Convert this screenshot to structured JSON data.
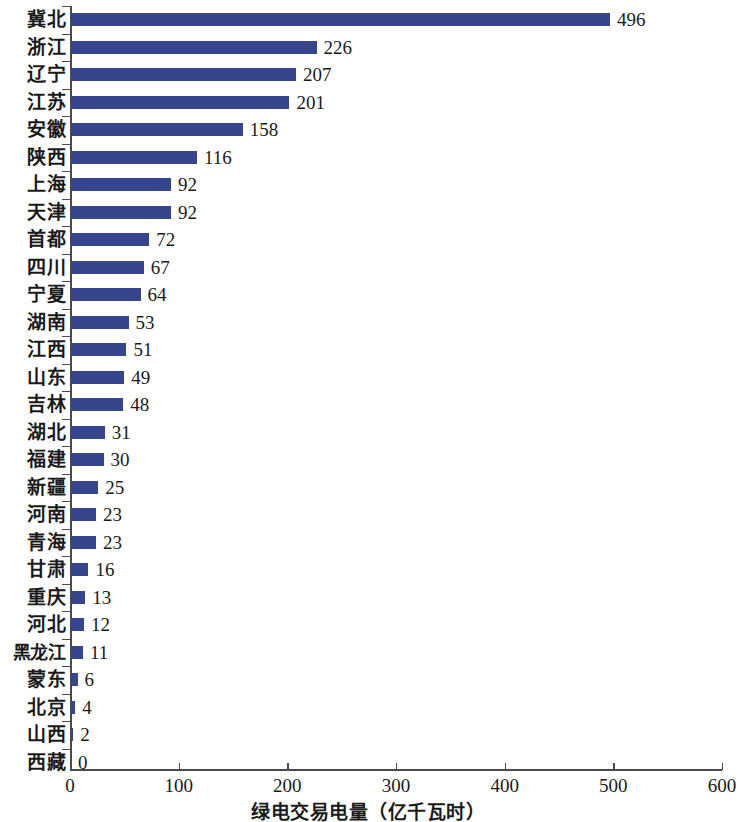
{
  "chart_data": {
    "type": "bar",
    "orientation": "horizontal",
    "title": "",
    "xlabel": "绿电交易电量（亿千瓦时）",
    "ylabel": "",
    "xlim": [
      0,
      600
    ],
    "xticks": [
      0,
      100,
      200,
      300,
      400,
      500,
      600
    ],
    "xtick_labels": [
      "0",
      "100",
      "200",
      "300",
      "400",
      "500",
      "600"
    ],
    "grid": false,
    "legend": null,
    "bar_color": "#37458c",
    "value_labels": true,
    "sorted": "descending",
    "categories": [
      "冀北",
      "浙江",
      "辽宁",
      "江苏",
      "安徽",
      "陕西",
      "上海",
      "天津",
      "首都",
      "四川",
      "宁夏",
      "湖南",
      "江西",
      "山东",
      "吉林",
      "湖北",
      "福建",
      "新疆",
      "河南",
      "青海",
      "甘肃",
      "重庆",
      "河北",
      "黑龙江",
      "蒙东",
      "北京",
      "山西",
      "西藏"
    ],
    "values": [
      496,
      226,
      207,
      201,
      158,
      116,
      92,
      92,
      72,
      67,
      64,
      53,
      51,
      49,
      48,
      31,
      30,
      25,
      23,
      23,
      16,
      13,
      12,
      11,
      6,
      4,
      2,
      0
    ],
    "value_label_texts": [
      "496",
      "226",
      "207",
      "201",
      "158",
      "116",
      "92",
      "92",
      "72",
      "67",
      "64",
      "53",
      "51",
      "49",
      "48",
      "31",
      "30",
      "25",
      "23",
      "23",
      "16",
      "13",
      "12",
      "11",
      "6",
      "4",
      "2",
      "0"
    ]
  }
}
